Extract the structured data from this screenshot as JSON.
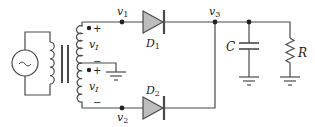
{
  "diagram": {
    "type": "circuit-schematic",
    "colors": {
      "wire": "#4a4a4a",
      "diode_fill": "#bdbdbd",
      "text": "#222222",
      "background": "#ffffff"
    },
    "labels": {
      "v1": "v",
      "v1_sub": "1",
      "v2": "v",
      "v2_sub": "2",
      "v3": "v",
      "v3_sub": "3",
      "vI_top": "v",
      "vI_top_sub": "I",
      "vI_bottom": "v",
      "vI_bottom_sub": "I",
      "D1": "D",
      "D1_sub": "1",
      "D2": "D",
      "D2_sub": "2",
      "C": "C",
      "R": "R",
      "plus_top": "+",
      "minus_top": "−",
      "plus_bottom": "+",
      "minus_bottom": "−",
      "source_symbol": "~"
    },
    "components": [
      {
        "id": "source",
        "kind": "ac-voltage-source"
      },
      {
        "id": "transformer",
        "kind": "center-tapped-transformer"
      },
      {
        "id": "D1",
        "kind": "diode"
      },
      {
        "id": "D2",
        "kind": "diode"
      },
      {
        "id": "C",
        "kind": "capacitor"
      },
      {
        "id": "R",
        "kind": "resistor"
      }
    ]
  }
}
